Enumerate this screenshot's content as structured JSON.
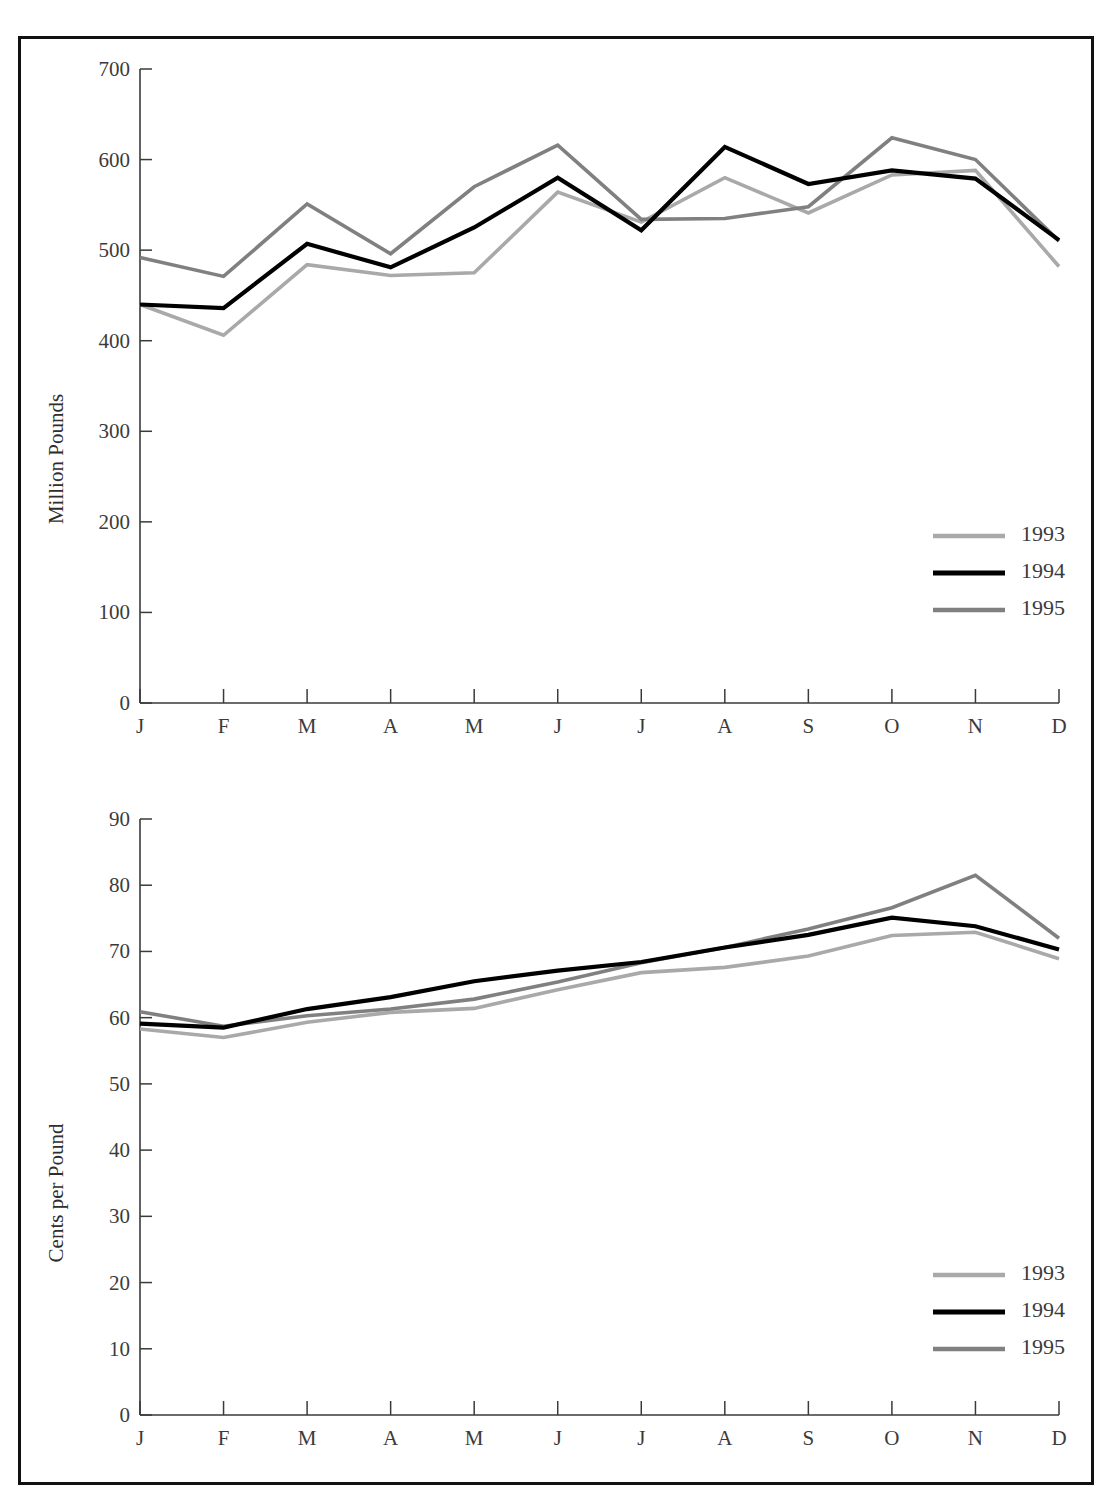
{
  "page": {
    "background": "#ffffff",
    "frame_color": "#111111"
  },
  "palette": {
    "series_1993": "#a9a9a9",
    "series_1994": "#000000",
    "series_1995": "#808080",
    "axis": "#3a3a3a",
    "text": "#3b3b3b"
  },
  "charts": [
    {
      "id": "milk-production",
      "ylabel": "Million Pounds",
      "xlabel": "",
      "legend_position": "bottom-right",
      "ticks_y": [
        "0",
        "100",
        "200",
        "300",
        "400",
        "500",
        "600",
        "700"
      ],
      "ticks_x": [
        "J",
        "F",
        "M",
        "A",
        "M",
        "J",
        "J",
        "A",
        "S",
        "O",
        "N",
        "D"
      ],
      "legend": [
        {
          "label": "1993",
          "color": "#a9a9a9"
        },
        {
          "label": "1994",
          "color": "#000000"
        },
        {
          "label": "1995",
          "color": "#808080"
        }
      ]
    },
    {
      "id": "milk-price",
      "ylabel": "Cents per Pound",
      "xlabel": "",
      "legend_position": "bottom-right",
      "ticks_y": [
        "0",
        "10",
        "20",
        "30",
        "40",
        "50",
        "60",
        "70",
        "80",
        "90"
      ],
      "ticks_x": [
        "J",
        "F",
        "M",
        "A",
        "M",
        "J",
        "J",
        "A",
        "S",
        "O",
        "N",
        "D"
      ],
      "legend": [
        {
          "label": "1993",
          "color": "#a9a9a9"
        },
        {
          "label": "1994",
          "color": "#000000"
        },
        {
          "label": "1995",
          "color": "#808080"
        }
      ]
    }
  ],
  "chart_data": [
    {
      "type": "line",
      "title": "",
      "xlabel": "",
      "ylabel": "Million Pounds",
      "categories": [
        "J",
        "F",
        "M",
        "A",
        "M",
        "J",
        "J",
        "A",
        "S",
        "O",
        "N",
        "D"
      ],
      "ylim": [
        0,
        700
      ],
      "yticks": [
        0,
        100,
        200,
        300,
        400,
        500,
        600,
        700
      ],
      "grid": false,
      "legend": "bottom-right",
      "series": [
        {
          "name": "1993",
          "color": "#a9a9a9",
          "values": [
            440,
            406,
            484,
            472,
            475,
            564,
            531,
            580,
            541,
            583,
            588,
            482
          ]
        },
        {
          "name": "1994",
          "color": "#000000",
          "values": [
            440,
            436,
            507,
            481,
            525,
            580,
            522,
            614,
            573,
            588,
            579,
            511
          ]
        },
        {
          "name": "1995",
          "color": "#808080",
          "values": [
            492,
            471,
            551,
            496,
            570,
            616,
            534,
            535,
            548,
            624,
            600,
            510
          ]
        }
      ]
    },
    {
      "type": "line",
      "title": "",
      "xlabel": "",
      "ylabel": "Cents per Pound",
      "categories": [
        "J",
        "F",
        "M",
        "A",
        "M",
        "J",
        "J",
        "A",
        "S",
        "O",
        "N",
        "D"
      ],
      "ylim": [
        0,
        90
      ],
      "yticks": [
        0,
        10,
        20,
        30,
        40,
        50,
        60,
        70,
        80,
        90
      ],
      "grid": false,
      "legend": "bottom-right",
      "series": [
        {
          "name": "1993",
          "color": "#a9a9a9",
          "values": [
            58.3,
            57.0,
            59.3,
            60.8,
            61.4,
            64.2,
            66.8,
            67.6,
            69.3,
            72.4,
            72.9,
            68.9
          ]
        },
        {
          "name": "1994",
          "color": "#000000",
          "values": [
            59.1,
            58.5,
            61.3,
            63.1,
            65.5,
            67.1,
            68.4,
            70.6,
            72.5,
            75.1,
            73.8,
            70.3
          ]
        },
        {
          "name": "1995",
          "color": "#808080",
          "values": [
            60.9,
            58.7,
            60.3,
            61.3,
            62.8,
            65.4,
            68.3,
            70.6,
            73.4,
            76.6,
            81.5,
            72.0
          ]
        }
      ]
    }
  ]
}
